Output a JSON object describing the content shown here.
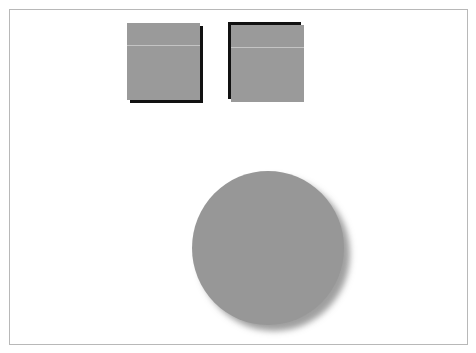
{
  "canvas": {
    "background": "#ffffff",
    "border_color": "#b8b8b8"
  },
  "shapes": [
    {
      "type": "square",
      "name": "square-shadow-bottom-right",
      "fill": "#9a9a9a",
      "shadow": "hard, black, offset down-right"
    },
    {
      "type": "square",
      "name": "square-shadow-top-left",
      "fill": "#9a9a9a",
      "shadow": "hard, black, offset up-left"
    },
    {
      "type": "circle",
      "name": "circle-soft-shadow",
      "fill": "#979797",
      "shadow": "soft blurred, offset down-right"
    }
  ]
}
